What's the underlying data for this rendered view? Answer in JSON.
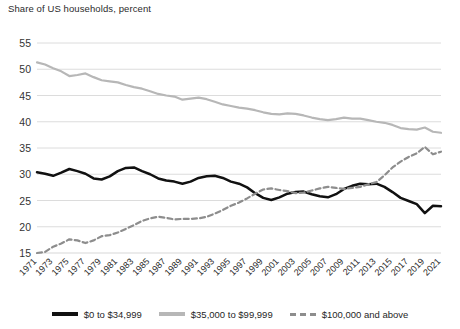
{
  "chart_data": {
    "type": "line",
    "title": "Share of US households, percent",
    "xlabel": "",
    "ylabel": "",
    "ylim": [
      15,
      55
    ],
    "yticks": [
      15,
      20,
      25,
      30,
      35,
      40,
      45,
      50,
      55
    ],
    "grid": true,
    "legend_position": "bottom",
    "x": [
      1971,
      1972,
      1973,
      1974,
      1975,
      1976,
      1977,
      1978,
      1979,
      1980,
      1981,
      1982,
      1983,
      1984,
      1985,
      1986,
      1987,
      1988,
      1989,
      1990,
      1991,
      1992,
      1993,
      1994,
      1995,
      1996,
      1997,
      1998,
      1999,
      2000,
      2001,
      2002,
      2003,
      2004,
      2005,
      2006,
      2007,
      2008,
      2009,
      2010,
      2011,
      2012,
      2013,
      2014,
      2015,
      2016,
      2017,
      2018,
      2019,
      2020,
      2021
    ],
    "xticks": [
      1971,
      1973,
      1975,
      1977,
      1979,
      1981,
      1983,
      1985,
      1987,
      1989,
      1991,
      1993,
      1995,
      1997,
      1999,
      2001,
      2003,
      2005,
      2007,
      2009,
      2011,
      2013,
      2015,
      2017,
      2019,
      2021
    ],
    "xtick_labels": [
      "1971",
      "1973",
      "1975",
      "1977",
      "1979",
      "1981",
      "1983",
      "1985",
      "1987",
      "1989",
      "1991",
      "1993",
      "1995",
      "1997",
      "1999",
      "2001",
      "2003",
      "2005",
      "2007",
      "2009",
      "2011",
      "2013",
      "2015",
      "2017",
      "2019",
      "2021"
    ],
    "series": [
      {
        "name": "$0 to $34,999",
        "color": "#111111",
        "style": "solid",
        "values": [
          30.4,
          30.1,
          29.7,
          30.3,
          31.0,
          30.6,
          30.1,
          29.2,
          29.0,
          29.6,
          30.6,
          31.2,
          31.3,
          30.6,
          30.0,
          29.2,
          28.8,
          28.6,
          28.2,
          28.6,
          29.3,
          29.6,
          29.7,
          29.3,
          28.6,
          28.2,
          27.5,
          26.4,
          25.5,
          25.1,
          25.6,
          26.3,
          26.6,
          26.7,
          26.2,
          25.8,
          25.6,
          26.2,
          27.2,
          27.8,
          28.2,
          28.1,
          28.2,
          27.6,
          26.6,
          25.5,
          24.9,
          24.3,
          22.6,
          24.0,
          23.9
        ]
      },
      {
        "name": "$35,000 to $99,999",
        "color": "#b7b7b7",
        "style": "solid",
        "values": [
          51.3,
          50.9,
          50.2,
          49.6,
          48.7,
          48.9,
          49.2,
          48.5,
          47.9,
          47.7,
          47.5,
          47.0,
          46.6,
          46.3,
          45.8,
          45.3,
          45.0,
          44.8,
          44.2,
          44.4,
          44.6,
          44.3,
          43.8,
          43.3,
          43.0,
          42.7,
          42.5,
          42.2,
          41.8,
          41.5,
          41.4,
          41.6,
          41.5,
          41.2,
          40.8,
          40.5,
          40.3,
          40.5,
          40.8,
          40.6,
          40.6,
          40.3,
          40.0,
          39.8,
          39.4,
          38.8,
          38.6,
          38.5,
          38.9,
          38.1,
          37.9
        ]
      },
      {
        "name": "$100,000 and above",
        "color": "#8d8d8d",
        "style": "dashed",
        "values": [
          15.0,
          15.2,
          16.2,
          16.8,
          17.6,
          17.4,
          16.9,
          17.4,
          18.2,
          18.4,
          18.9,
          19.6,
          20.3,
          21.1,
          21.6,
          21.9,
          21.7,
          21.4,
          21.5,
          21.5,
          21.6,
          21.9,
          22.5,
          23.2,
          24.0,
          24.6,
          25.4,
          26.3,
          27.1,
          27.3,
          27.0,
          26.8,
          26.4,
          26.5,
          26.9,
          27.3,
          27.6,
          27.4,
          27.2,
          27.4,
          27.6,
          28.1,
          28.5,
          29.8,
          31.3,
          32.4,
          33.3,
          34.0,
          35.2,
          33.8,
          34.3
        ]
      }
    ]
  },
  "legend": {
    "items": [
      {
        "label": "$0 to $34,999",
        "style": "solid-dark"
      },
      {
        "label": "$35,000 to $99,999",
        "style": "solid-gray"
      },
      {
        "label": "$100,000 and above",
        "style": "dashed-gray"
      }
    ]
  },
  "colors": {
    "grid": "#d8d8d8",
    "axis_text": "#2b2b2b",
    "background": "#ffffff"
  }
}
